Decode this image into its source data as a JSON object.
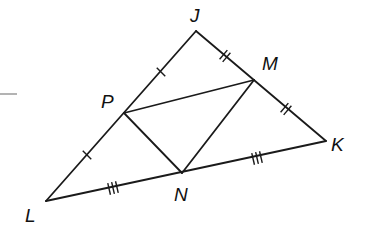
{
  "diagram": {
    "type": "geometry-triangle-midsegments",
    "points": {
      "J": {
        "x": 196,
        "y": 31
      },
      "K": {
        "x": 326,
        "y": 141
      },
      "L": {
        "x": 46,
        "y": 201
      },
      "M": {
        "x": 254,
        "y": 80
      },
      "N": {
        "x": 182,
        "y": 173
      },
      "P": {
        "x": 124,
        "y": 113
      }
    },
    "labels": {
      "J": {
        "text": "J",
        "x": 190,
        "y": 22
      },
      "M": {
        "text": "M",
        "x": 262,
        "y": 70
      },
      "P": {
        "text": "P",
        "x": 101,
        "y": 108
      },
      "K": {
        "text": "K",
        "x": 331,
        "y": 151
      },
      "N": {
        "text": "N",
        "x": 174,
        "y": 201
      },
      "L": {
        "text": "L",
        "x": 25,
        "y": 222
      }
    },
    "segments": [
      {
        "from": "J",
        "to": "K",
        "name": "side-JK"
      },
      {
        "from": "K",
        "to": "L",
        "name": "side-KL"
      },
      {
        "from": "L",
        "to": "J",
        "name": "side-LJ"
      },
      {
        "from": "P",
        "to": "M",
        "name": "midsegment-PM"
      },
      {
        "from": "M",
        "to": "N",
        "name": "midsegment-MN"
      },
      {
        "from": "N",
        "to": "P",
        "name": "midsegment-NP"
      }
    ],
    "tick_marks": [
      {
        "segment": "JP",
        "count": 1,
        "x": 161,
        "y": 72,
        "angle": -45
      },
      {
        "segment": "PL",
        "count": 1,
        "x": 87,
        "y": 155,
        "angle": -45
      },
      {
        "segment": "JM",
        "count": 2,
        "x": 225,
        "y": 56,
        "angle": 40
      },
      {
        "segment": "MK",
        "count": 2,
        "x": 286,
        "y": 109,
        "angle": 40
      },
      {
        "segment": "LN",
        "count": 3,
        "x": 113,
        "y": 188,
        "angle": -13
      },
      {
        "segment": "NK",
        "count": 3,
        "x": 257,
        "y": 158,
        "angle": -13
      }
    ],
    "stub_line": {
      "x1": 0,
      "y1": 94,
      "x2": 17,
      "y2": 94
    }
  }
}
